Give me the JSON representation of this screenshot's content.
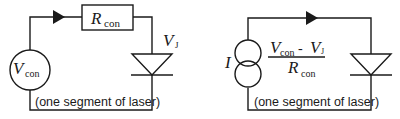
{
  "figure": {
    "left_circuit": {
      "source_label": "V",
      "source_subscript": "con",
      "resistor_label": "R",
      "resistor_subscript": "con",
      "junction_label": "V",
      "junction_subscript": "J",
      "caption": "(one segment of laser)"
    },
    "right_circuit": {
      "source_label": "I",
      "numerator_v1": "V",
      "numerator_v1_sub": "con",
      "minus": "-",
      "numerator_v2": "V",
      "numerator_v2_sub": "J",
      "denominator": "R",
      "denominator_sub": "con",
      "caption": "(one segment of laser)"
    }
  }
}
